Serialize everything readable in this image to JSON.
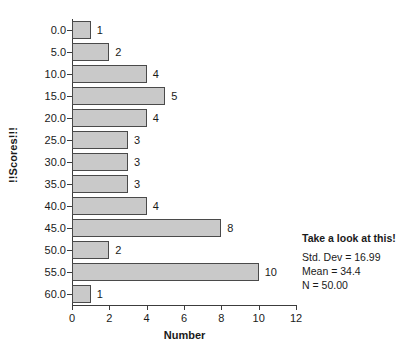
{
  "chart_data": {
    "type": "bar",
    "orientation": "horizontal",
    "title": "",
    "xlabel": "Number",
    "ylabel": "!!Scores!!!",
    "categories": [
      "0.0",
      "5.0",
      "10.0",
      "15.0",
      "20.0",
      "25.0",
      "30.0",
      "35.0",
      "40.0",
      "45.0",
      "50.0",
      "55.0",
      "60.0"
    ],
    "values": [
      1,
      2,
      4,
      5,
      4,
      3,
      3,
      3,
      4,
      8,
      2,
      10,
      1
    ],
    "data_labels": [
      "1",
      "2",
      "4",
      "5",
      "4",
      "3",
      "3",
      "3",
      "4",
      "8",
      "2",
      "10",
      "1"
    ],
    "xlim": [
      0,
      12
    ],
    "xticks": [
      0,
      2,
      4,
      6,
      8,
      10,
      12
    ],
    "xtick_labels": [
      "0",
      "2",
      "4",
      "6",
      "8",
      "10",
      "12"
    ],
    "grid": false,
    "legend": null,
    "bar_color": "#c9c9c9",
    "bar_edge_color": "#4a4a4a",
    "axis_color": "#3c3c3c",
    "annotations": {
      "title": "Take a look at this!",
      "lines": [
        "Std. Dev = 16.99",
        "Mean = 34.4",
        "N = 50.00"
      ]
    }
  }
}
